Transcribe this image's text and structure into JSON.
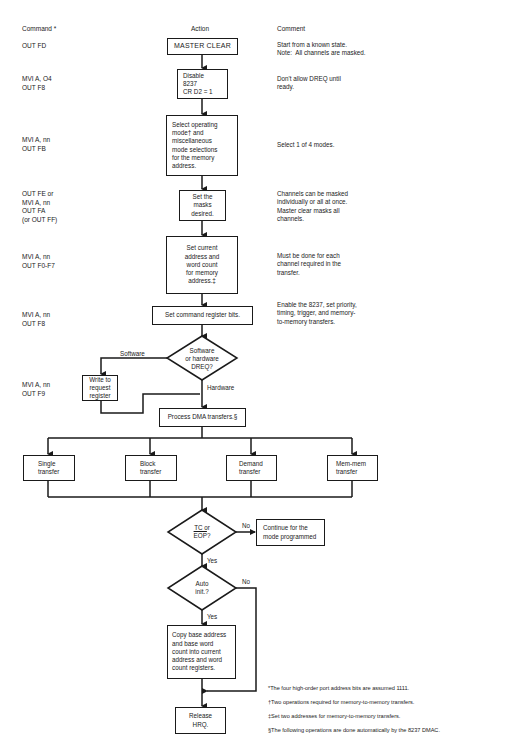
{
  "headers": {
    "command": "Command *",
    "action": "Action",
    "comment": "Comment"
  },
  "rows": [
    {
      "command": "OUT FD",
      "comment": "Start from a known state.\nNote:  All channels are masked."
    },
    {
      "command": "MVI A, O4\nOUT F8",
      "comment": "Don't allow DREQ until\nready."
    },
    {
      "command": "MVI A, nn\nOUT FB",
      "comment": "Select 1 of 4 modes."
    },
    {
      "command": "OUT FE or\nMVI A, nn\nOUT FA\n(or OUT FF)",
      "comment": "Channels can be masked\nindividually or all at once.\nMaster clear masks all\nchannels."
    },
    {
      "command": "MVI A, nn\nOUT F0-F7",
      "comment": "Must be done for each\nchannel required in the\ntransfer."
    },
    {
      "command": "MVI A, nn\nOUT F8",
      "comment": "Enable the 8237, set priority,\ntiming, trigger, and memory-\nto-memory transfers."
    },
    {
      "command": "MVI A, nn\nOUT F9",
      "comment": ""
    }
  ],
  "flow": {
    "master_clear": "MASTER CLEAR",
    "disable": "Disable\n8237\nCR D2 = 1",
    "select_mode": "Select operating\nmode† and\nmiscellaneous\nmode selections\nfor the memory\naddress.",
    "set_masks": "Set the\nmasks\ndesired.",
    "set_address": "Set current\naddress and\nword count\nfor memory\naddress.‡",
    "set_command": "Set command register bits.",
    "dreq_decision": "Software\nor hardware\nDREQ?",
    "software_label": "Software",
    "hardware_label": "Hardware",
    "write_request": "Write to\nrequest\nregister",
    "process_dma": "Process DMA transfers.§",
    "transfers": [
      "Single\ntransfer",
      "Block\ntransfer",
      "Demand\ntransfer",
      "Mem-mem\ntransfer"
    ],
    "tc_decision": "TC or\nEOP?",
    "tc_no_label": "No",
    "tc_yes_label": "Yes",
    "continue_box": "Continue for the\nmode programmed",
    "auto_decision": "Auto\ninit.?",
    "auto_no_label": "No",
    "auto_yes_label": "Yes",
    "copy_box": "Copy base address\nand base word\ncount into current\naddress and word\ncount registers.",
    "release": "Release\nHRQ."
  },
  "footnotes": [
    "*The four high-order port address bits are assumed 1111.",
    "†Two operations required for memory-to-memory transfers.",
    "‡Set two addresses for memory-to-memory transfers.",
    "§The following operations are done automatically by the 8237 DMAC."
  ]
}
